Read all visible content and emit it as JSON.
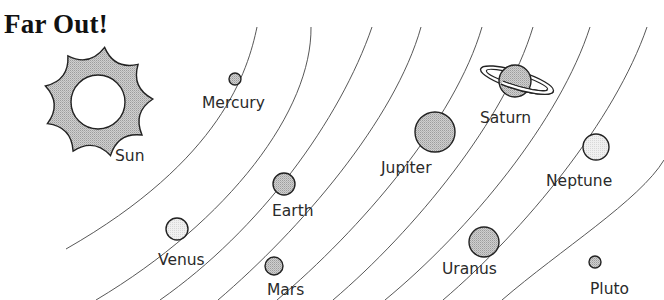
{
  "title": "Far Out!",
  "sun": {
    "label": "Sun",
    "points": 9
  },
  "planets": [
    {
      "name": "Mercury",
      "shade": "medium"
    },
    {
      "name": "Venus",
      "shade": "light"
    },
    {
      "name": "Earth",
      "shade": "medium"
    },
    {
      "name": "Mars",
      "shade": "medium"
    },
    {
      "name": "Jupiter",
      "shade": "medium"
    },
    {
      "name": "Saturn",
      "shade": "medium",
      "ringed": true
    },
    {
      "name": "Uranus",
      "shade": "medium"
    },
    {
      "name": "Neptune",
      "shade": "light"
    },
    {
      "name": "Pluto",
      "shade": "medium"
    }
  ],
  "colors": {
    "medium_fill": "#c4c4c4",
    "light_fill": "#e9e9e9",
    "sun_fill": "#b9b9b9",
    "stroke": "#222222"
  }
}
